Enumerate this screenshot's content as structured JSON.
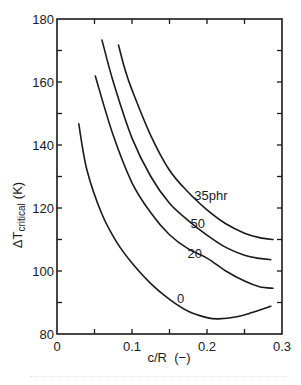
{
  "chart_data": {
    "type": "line",
    "title": "",
    "xlabel": "c/R  (−)",
    "ylabel": "ΔT",
    "ylabel_subscript": "critical",
    "ylabel_unit": "(K)",
    "xlim": [
      0,
      0.3
    ],
    "ylim": [
      80,
      180
    ],
    "x_ticks": [
      0,
      0.1,
      0.2,
      0.3
    ],
    "x_tick_labels": [
      "0",
      "0.1",
      "0.2",
      "0.3"
    ],
    "x_minor_ticks": [
      0.05,
      0.15,
      0.25
    ],
    "y_ticks": [
      80,
      100,
      120,
      140,
      160,
      180
    ],
    "y_tick_labels": [
      "80",
      "100",
      "120",
      "140",
      "160",
      "180"
    ],
    "y_minor_ticks": [
      90,
      110,
      130,
      150,
      170
    ],
    "grid": false,
    "legend": "inline curve labels",
    "series": [
      {
        "name": "35phr",
        "label_pos": [
          0.183,
          122.5
        ],
        "x": [
          0.082,
          0.09,
          0.1,
          0.125,
          0.15,
          0.175,
          0.2,
          0.225,
          0.25,
          0.27,
          0.288
        ],
        "y": [
          171.7,
          164.5,
          157.5,
          143.0,
          132.0,
          125.0,
          119.4,
          115.0,
          112.0,
          110.6,
          110.0
        ]
      },
      {
        "name": "50",
        "label_pos": [
          0.178,
          113.5
        ],
        "x": [
          0.06,
          0.075,
          0.1,
          0.125,
          0.15,
          0.175,
          0.2,
          0.225,
          0.25,
          0.27,
          0.285
        ],
        "y": [
          173.3,
          160.0,
          142.2,
          130.0,
          121.5,
          116.0,
          111.4,
          107.5,
          105.0,
          104.0,
          103.6
        ]
      },
      {
        "name": "20",
        "label_pos": [
          0.174,
          104.0
        ],
        "x": [
          0.051,
          0.075,
          0.1,
          0.125,
          0.15,
          0.175,
          0.2,
          0.225,
          0.25,
          0.27,
          0.288
        ],
        "y": [
          161.9,
          143.0,
          128.0,
          118.5,
          111.5,
          107.0,
          104.1,
          100.0,
          96.8,
          95.0,
          94.5
        ]
      },
      {
        "name": "0",
        "label_pos": [
          0.16,
          90.0
        ],
        "x": [
          0.029,
          0.04,
          0.06,
          0.08,
          0.1,
          0.125,
          0.15,
          0.175,
          0.2,
          0.215,
          0.24,
          0.26,
          0.285
        ],
        "y": [
          146.7,
          132.0,
          118.0,
          109.0,
          102.5,
          96.0,
          91.0,
          87.2,
          85.2,
          84.8,
          85.5,
          86.8,
          88.8
        ]
      }
    ]
  },
  "colors": {
    "line": "#1a1a1a",
    "background": "#ffffff"
  }
}
